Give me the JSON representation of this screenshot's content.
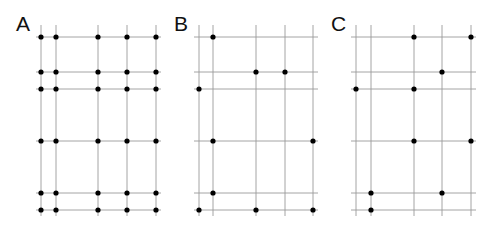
{
  "panels": [
    {
      "label": "A",
      "label_pos": [
        16,
        13
      ],
      "x_lines": [
        41,
        56,
        98,
        127,
        156
      ],
      "y_lines": [
        37,
        72,
        89,
        141,
        193,
        210
      ],
      "dots": "all"
    },
    {
      "label": "B",
      "label_pos": [
        174,
        13
      ],
      "x_lines": [
        199,
        213,
        256,
        285,
        313
      ],
      "y_lines": [
        37,
        72,
        89,
        141,
        193,
        210
      ],
      "dots": [
        [
          213,
          37
        ],
        [
          256,
          72
        ],
        [
          285,
          72
        ],
        [
          199,
          89
        ],
        [
          213,
          141
        ],
        [
          313,
          141
        ],
        [
          213,
          193
        ],
        [
          199,
          210
        ],
        [
          256,
          210
        ],
        [
          313,
          210
        ]
      ]
    },
    {
      "label": "C",
      "label_pos": [
        331,
        13
      ],
      "x_lines": [
        356,
        371,
        414,
        442,
        471
      ],
      "y_lines": [
        37,
        72,
        89,
        141,
        193,
        210
      ],
      "dots": [
        [
          414,
          37
        ],
        [
          471,
          37
        ],
        [
          442,
          72
        ],
        [
          356,
          89
        ],
        [
          414,
          89
        ],
        [
          414,
          141
        ],
        [
          471,
          141
        ],
        [
          371,
          193
        ],
        [
          442,
          193
        ],
        [
          371,
          210
        ]
      ]
    }
  ],
  "colors": {
    "line": "#9a9a9a",
    "dot": "#000000",
    "label": "#111111"
  }
}
